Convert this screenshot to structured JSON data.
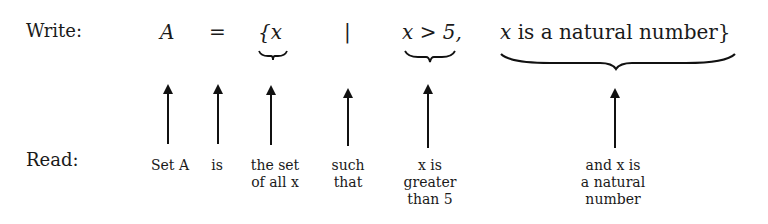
{
  "write_row": {
    "label": "Write:",
    "A": "A",
    "equals": "=",
    "brace_open_x": "{x",
    "bar": "|",
    "cond1": "x > 5,",
    "cond2_var": "x",
    "cond2_text": " is a natural number}"
  },
  "read_row": {
    "label": "Read:",
    "items": [
      {
        "line1": "Set A",
        "line2": ""
      },
      {
        "line1": "is",
        "line2": ""
      },
      {
        "line1": "the set",
        "line2": "of all x"
      },
      {
        "line1": "such",
        "line2": "that"
      },
      {
        "line1": "x is",
        "line2": "greater",
        "line3": "than 5"
      },
      {
        "line1": "and x is",
        "line2": "a natural",
        "line3": "number"
      }
    ]
  }
}
